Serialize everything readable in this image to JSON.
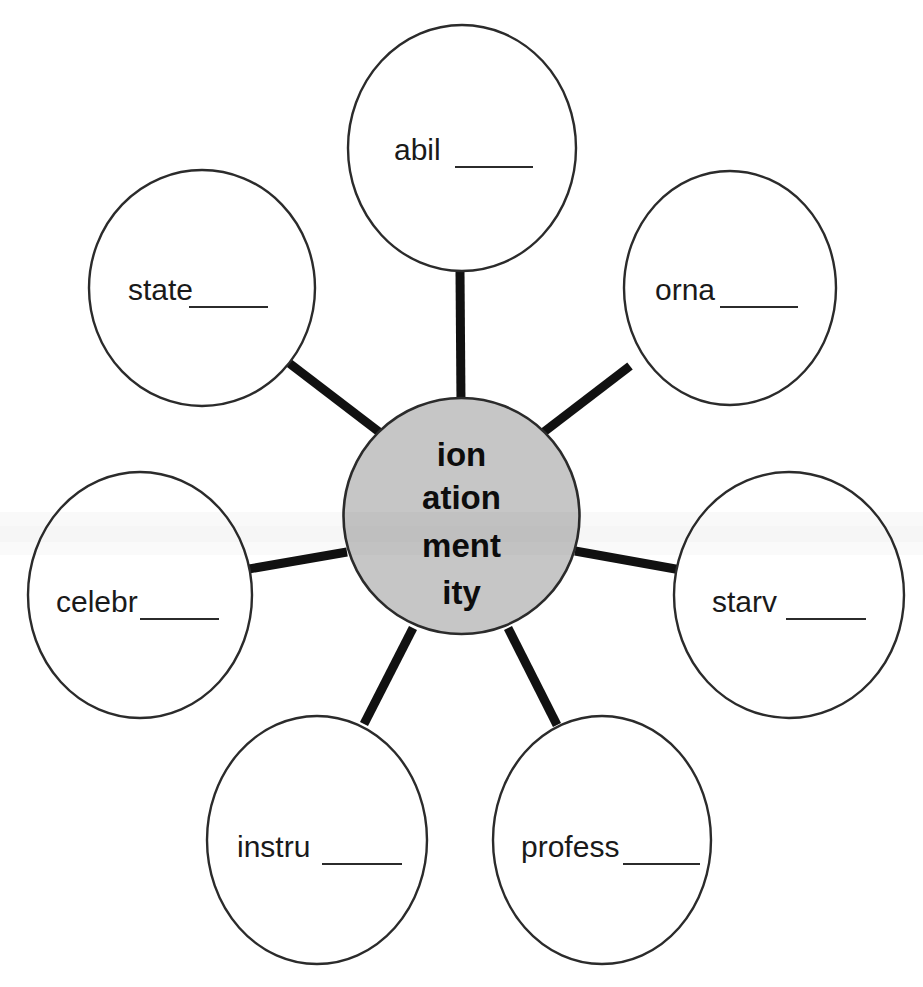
{
  "worksheet": {
    "title": "Suffix Word Web",
    "center": {
      "name": "center-suffix-bubble",
      "lines": [
        "ion",
        "ation",
        "ment",
        "ity"
      ],
      "fill_color": "#c6c6c6",
      "stroke_color": "#2b2b2b"
    },
    "background_color": "#ffffff",
    "nodes": [
      {
        "id": "abil",
        "name": "bubble-abil",
        "stem": "abil",
        "blank": "______",
        "position": "top",
        "cx": 462,
        "cy": 148,
        "rx": 114,
        "ry": 123,
        "text_x": 394,
        "text_y": 160,
        "rule_x1": 455,
        "rule_x2": 533,
        "rule_y": 167
      },
      {
        "id": "orna",
        "name": "bubble-orna",
        "stem": "orna",
        "blank": "______",
        "position": "top-right",
        "cx": 730,
        "cy": 288,
        "rx": 106,
        "ry": 117,
        "text_x": 655,
        "text_y": 300,
        "rule_x1": 720,
        "rule_x2": 798,
        "rule_y": 307
      },
      {
        "id": "starv",
        "name": "bubble-starv",
        "stem": "starv",
        "blank": "______",
        "position": "right",
        "cx": 789,
        "cy": 595,
        "rx": 115,
        "ry": 123,
        "text_x": 712,
        "text_y": 612,
        "rule_x1": 786,
        "rule_x2": 866,
        "rule_y": 619
      },
      {
        "id": "profess",
        "name": "bubble-profess",
        "stem": "profess",
        "blank": "______",
        "position": "bottom-right",
        "cx": 602,
        "cy": 840,
        "rx": 109,
        "ry": 124,
        "text_x": 521,
        "text_y": 857,
        "rule_x1": 623,
        "rule_x2": 700,
        "rule_y": 864
      },
      {
        "id": "instru",
        "name": "bubble-instru",
        "stem": "instru",
        "blank": "______",
        "position": "bottom-left",
        "cx": 317,
        "cy": 840,
        "rx": 110,
        "ry": 124,
        "text_x": 237,
        "text_y": 857,
        "rule_x1": 322,
        "rule_x2": 402,
        "rule_y": 864
      },
      {
        "id": "celebr",
        "name": "bubble-celebr",
        "stem": "celebr",
        "blank": "______",
        "position": "left",
        "cx": 140,
        "cy": 595,
        "rx": 112,
        "ry": 123,
        "text_x": 56,
        "text_y": 612,
        "rule_x1": 140,
        "rule_x2": 219,
        "rule_y": 619
      },
      {
        "id": "state",
        "name": "bubble-state",
        "stem": "state",
        "blank": "______",
        "position": "top-left",
        "cx": 202,
        "cy": 288,
        "rx": 113,
        "ry": 118,
        "text_x": 128,
        "text_y": 300,
        "rule_x1": 189,
        "rule_x2": 268,
        "rule_y": 307
      }
    ],
    "spokes": [
      {
        "name": "spoke-to-abil",
        "x1": 461,
        "y1": 404,
        "x2": 460,
        "y2": 272
      },
      {
        "name": "spoke-to-orna",
        "x1": 536,
        "y1": 438,
        "x2": 630,
        "y2": 366
      },
      {
        "name": "spoke-to-starv",
        "x1": 575,
        "y1": 551,
        "x2": 681,
        "y2": 570
      },
      {
        "name": "spoke-to-profess",
        "x1": 508,
        "y1": 628,
        "x2": 557,
        "y2": 725
      },
      {
        "name": "spoke-to-instru",
        "x1": 413,
        "y1": 628,
        "x2": 364,
        "y2": 724
      },
      {
        "name": "spoke-to-celebr",
        "x1": 347,
        "y1": 552,
        "x2": 243,
        "y2": 570
      },
      {
        "name": "spoke-to-state",
        "x1": 387,
        "y1": 438,
        "x2": 289,
        "y2": 363
      }
    ]
  }
}
